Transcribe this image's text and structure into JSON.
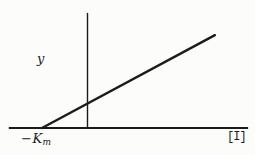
{
  "figure": {
    "background_color": "#fcfcfb",
    "line_color": "#1b1b1b"
  },
  "labels": {
    "y_axis": "y",
    "x_axis": "[I]",
    "x_intercept_base": "−K",
    "x_intercept_sub": "m"
  },
  "chart_data": {
    "type": "line",
    "title": "",
    "xlabel": "[I]",
    "ylabel": "y",
    "x_intercept_label": "-Km",
    "xlim": [
      -1.73,
      3.53
    ],
    "ylim": [
      0,
      2.53
    ],
    "grid": false,
    "legend": false,
    "axes": {
      "x_axis_from": [
        -1.73,
        0
      ],
      "x_axis_to": [
        3.53,
        0
      ],
      "y_axis_from": [
        0,
        0
      ],
      "y_axis_to": [
        0,
        2.53
      ]
    },
    "series": [
      {
        "name": "straight-line-through-minus-Km",
        "points": [
          [
            -1.0,
            0.0
          ],
          [
            2.8,
            2.04
          ]
        ]
      }
    ],
    "annotations": [
      {
        "text": "-Km",
        "position": "x-axis intercept, below axis"
      },
      {
        "text": "y",
        "position": "left of vertical axis, upper area"
      },
      {
        "text": "[I]",
        "position": "below right end of x-axis"
      }
    ]
  }
}
